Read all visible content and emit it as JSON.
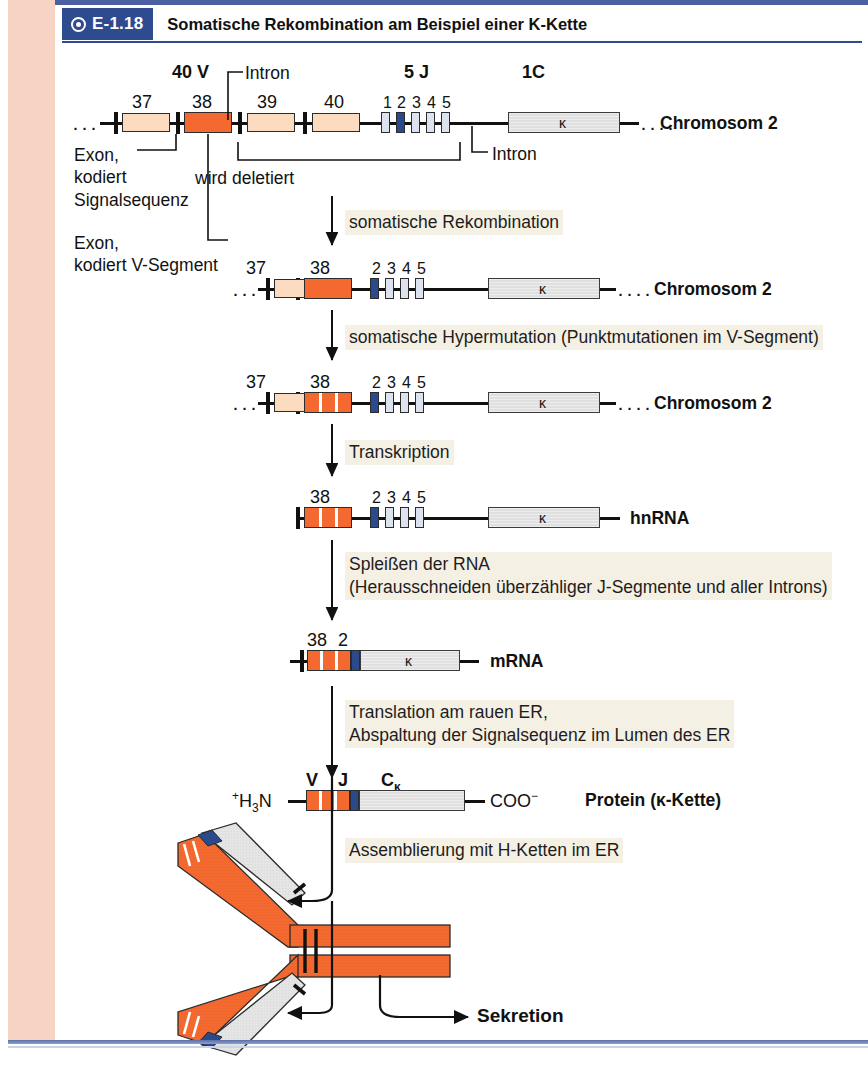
{
  "caption": {
    "tag": "E-1.18",
    "icon": "bullseye-icon",
    "title": "Somatische Rekombination am Beispiel einer K-Kette"
  },
  "colors": {
    "accent_blue": "#2f4b8f",
    "exon_pale": "#fbdcc0",
    "exon_orange": "#f4692f",
    "j_segment_pale": "#dde3ee",
    "j_segment_dark": "#2b4a8c",
    "constant_grey": "#e4e4e4",
    "left_strip_pink": "#f7d3c4",
    "step_label_bg": "#f5f0e4"
  },
  "row1": {
    "group_labels": {
      "v": "40 V",
      "j": "5 J",
      "c": "1C"
    },
    "segment_numbers": [
      "37",
      "38",
      "39",
      "40"
    ],
    "j_numbers": [
      "1",
      "2",
      "3",
      "4",
      "5"
    ],
    "c_label": "κ",
    "row_label": "Chromosom 2",
    "intron_label_top": "Intron",
    "intron_label_bottom": "Intron",
    "annotation_exon_signal": [
      "Exon,",
      "kodiert",
      "Signalsequenz"
    ],
    "annotation_exon_v": [
      "Exon,",
      "kodiert V-Segment"
    ],
    "deleted_label": "wird deletiert",
    "leading_dots": "···",
    "trailing_dots": "····"
  },
  "step1": {
    "label": "somatische Rekombination"
  },
  "row2": {
    "segment_numbers": [
      "37",
      "38"
    ],
    "j_numbers": [
      "2",
      "3",
      "4",
      "5"
    ],
    "c_label": "κ",
    "row_label": "Chromosom 2",
    "leading_dots": "···",
    "trailing_dots": "····"
  },
  "step2": {
    "label": "somatische Hypermutation (Punktmutationen im V-Segment)"
  },
  "row3": {
    "segment_numbers": [
      "37",
      "38"
    ],
    "j_numbers": [
      "2",
      "3",
      "4",
      "5"
    ],
    "c_label": "κ",
    "row_label": "Chromosom 2",
    "leading_dots": "···",
    "trailing_dots": "····",
    "mutation_count": 2
  },
  "step3": {
    "label": "Transkription"
  },
  "row4": {
    "segment_numbers": [
      "38"
    ],
    "j_numbers": [
      "2",
      "3",
      "4",
      "5"
    ],
    "c_label": "κ",
    "row_label": "hnRNA"
  },
  "step4": {
    "label": "Spleißen der RNA\n(Herausschneiden überzähliger J-Segmente und aller Introns)"
  },
  "row5": {
    "segment_numbers": [
      "38",
      "2"
    ],
    "c_label": "κ",
    "row_label": "mRNA"
  },
  "step5": {
    "label": "Translation am rauen ER,\nAbspaltung der Signalsequenz im Lumen des ER"
  },
  "row6": {
    "domain_labels": [
      "V",
      "J"
    ],
    "c_domain_label": "C",
    "c_domain_sub": "κ",
    "n_terminus": "H",
    "n_terminus_sup": "+",
    "n_terminus_sub": "3",
    "n_terminus_tail": "N",
    "c_terminus": "COO",
    "c_terminus_sup": "−",
    "c_label": "κ",
    "row_label": "Protein (κ-Kette)"
  },
  "step6": {
    "label": "Assemblierung mit H-Ketten im ER"
  },
  "secretion": {
    "label": "Sekretion"
  }
}
